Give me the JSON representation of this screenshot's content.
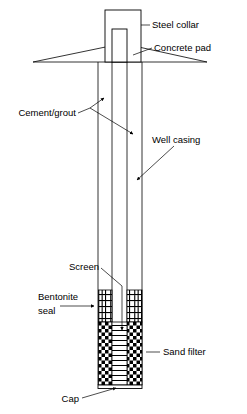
{
  "figure": {
    "background_color": "#ffffff",
    "line_color": "#000000"
  },
  "labels": {
    "steel_collar": "Steel collar",
    "concrete_pad": "Concrete pad",
    "cement_grout": "Cement/grout",
    "well_casing": "Well casing",
    "screen": "Screen",
    "bentonite_seal_line1": "Bentonite",
    "bentonite_seal_line2": "seal",
    "sand_filter": "Sand filter",
    "cap": "Cap"
  },
  "components": [
    {
      "name": "steel-collar",
      "label": "Steel collar",
      "pattern": "outline"
    },
    {
      "name": "concrete-pad",
      "label": "Concrete pad",
      "pattern": "outline"
    },
    {
      "name": "cement-grout",
      "label": "Cement/grout",
      "pattern": "blank"
    },
    {
      "name": "well-casing",
      "label": "Well casing",
      "pattern": "outline"
    },
    {
      "name": "screen",
      "label": "Screen",
      "pattern": "horizontal-lines"
    },
    {
      "name": "bentonite-seal",
      "label": "Bentonite seal",
      "pattern": "brick-hatch"
    },
    {
      "name": "sand-filter",
      "label": "Sand filter",
      "pattern": "checkerboard"
    },
    {
      "name": "cap",
      "label": "Cap",
      "pattern": "solid"
    }
  ]
}
